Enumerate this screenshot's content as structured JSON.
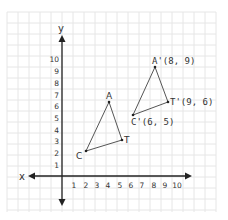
{
  "diagram": {
    "type": "coordinate-plane-translation",
    "axes": {
      "x_label": "x",
      "y_label": "y",
      "x_ticks": [
        "1",
        "2",
        "3",
        "4",
        "5",
        "6",
        "7",
        "8",
        "9",
        "10"
      ],
      "y_ticks": [
        "1",
        "2",
        "3",
        "4",
        "5",
        "6",
        "7",
        "8",
        "9",
        "10"
      ]
    },
    "original_triangle": {
      "points": [
        {
          "name": "A",
          "label": "A",
          "x": 4,
          "y": 6
        },
        {
          "name": "T",
          "label": "T",
          "x": 5,
          "y": 3
        },
        {
          "name": "C",
          "label": "C",
          "x": 2,
          "y": 2
        }
      ]
    },
    "image_triangle": {
      "points": [
        {
          "name": "A'",
          "label": "A'(8, 9)",
          "x": 8,
          "y": 9
        },
        {
          "name": "T'",
          "label": "T'(9, 6)",
          "x": 9,
          "y": 6
        },
        {
          "name": "C'",
          "label": "C'(6, 5)",
          "x": 6,
          "y": 5
        }
      ]
    },
    "colors": {
      "grid": "#e4e4e4",
      "axis": "#222222",
      "line": "#555555",
      "text": "#333333"
    }
  }
}
